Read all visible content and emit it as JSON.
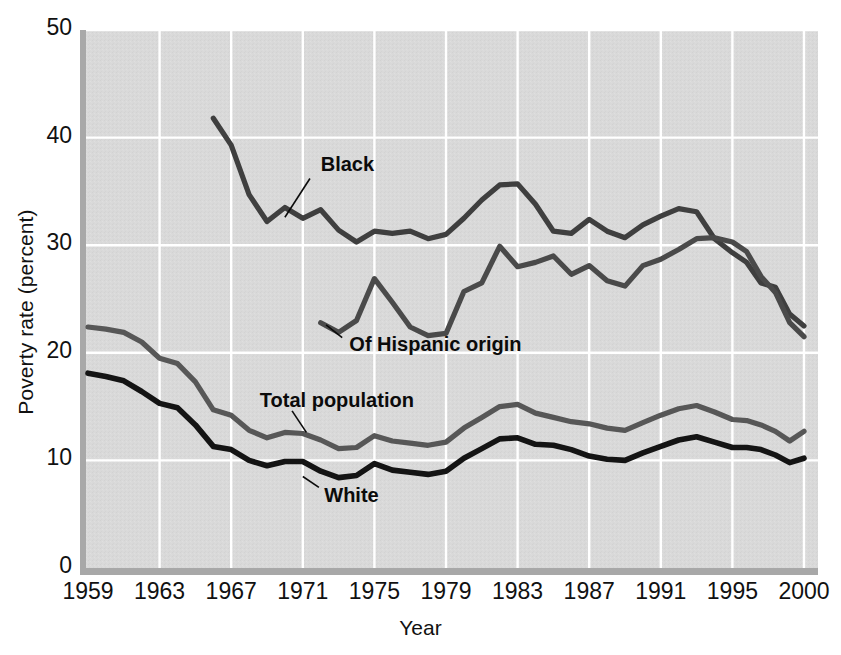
{
  "chart_data": {
    "type": "line",
    "title": "",
    "xlabel": "Year",
    "ylabel": "Poverty rate (percent)",
    "xlim": [
      1959,
      2000
    ],
    "ylim": [
      0,
      50
    ],
    "xticks": [
      "1959",
      "1963",
      "1967",
      "1971",
      "1975",
      "1979",
      "1983",
      "1987",
      "1991",
      "1995",
      "2000"
    ],
    "xtick_values": [
      1959,
      1963,
      1967,
      1971,
      1975,
      1979,
      1983,
      1987,
      1991,
      1995,
      2000
    ],
    "yticks": [
      "0",
      "10",
      "20",
      "30",
      "40",
      "50"
    ],
    "ytick_values": [
      0,
      10,
      20,
      30,
      40,
      50
    ],
    "grid": true,
    "grid_color": "#ffffff",
    "plot_background": "#d8d8d8",
    "legend_position": "inline-annotations",
    "series": [
      {
        "name": "Black",
        "color": "#3f3f3f",
        "label_x": 1972.0,
        "label_y": 37.4,
        "leader_from_x": 1971.4,
        "leader_from_y": 36.2,
        "leader_to_x": 1970.0,
        "leader_to_y": 32.6,
        "x": [
          1966,
          1967,
          1968,
          1969,
          1970,
          1971,
          1972,
          1973,
          1974,
          1975,
          1976,
          1977,
          1978,
          1979,
          1980,
          1981,
          1982,
          1983,
          1984,
          1985,
          1986,
          1987,
          1988,
          1989,
          1990,
          1991,
          1992,
          1993,
          1994,
          1995,
          1996,
          1997,
          1998,
          1999,
          2000
        ],
        "values": [
          41.8,
          39.3,
          34.7,
          32.2,
          33.5,
          32.5,
          33.3,
          31.4,
          30.3,
          31.3,
          31.1,
          31.3,
          30.6,
          31.0,
          32.5,
          34.2,
          35.6,
          35.7,
          33.8,
          31.3,
          31.1,
          32.4,
          31.3,
          30.7,
          31.9,
          32.7,
          33.4,
          33.1,
          30.6,
          29.3,
          28.4,
          26.5,
          26.1,
          23.6,
          22.5
        ],
        "units": "percent"
      },
      {
        "name": "Of Hispanic origin",
        "color": "#4a4a4a",
        "label_x": 1973.6,
        "label_y": 20.6,
        "leader_from_x": 1973.2,
        "leader_from_y": 21.4,
        "leader_to_x": 1972.3,
        "leader_to_y": 22.6,
        "x": [
          1972,
          1973,
          1974,
          1975,
          1976,
          1977,
          1978,
          1979,
          1980,
          1981,
          1982,
          1983,
          1984,
          1985,
          1986,
          1987,
          1988,
          1989,
          1990,
          1991,
          1992,
          1993,
          1994,
          1995,
          1996,
          1997,
          1998,
          1999,
          2000
        ],
        "values": [
          22.8,
          21.9,
          23.0,
          26.9,
          24.7,
          22.4,
          21.6,
          21.8,
          25.7,
          26.5,
          29.9,
          28.0,
          28.4,
          29.0,
          27.3,
          28.1,
          26.7,
          26.2,
          28.1,
          28.7,
          29.6,
          30.6,
          30.7,
          30.3,
          29.4,
          27.1,
          25.6,
          22.8,
          21.5
        ],
        "units": "percent"
      },
      {
        "name": "Total population",
        "color": "#575757",
        "label_x": 1968.6,
        "label_y": 15.4,
        "leader_from_x": 1970.4,
        "leader_from_y": 14.6,
        "leader_to_x": 1971.2,
        "leader_to_y": 12.6,
        "x": [
          1959,
          1960,
          1961,
          1962,
          1963,
          1964,
          1965,
          1966,
          1967,
          1968,
          1969,
          1970,
          1971,
          1972,
          1973,
          1974,
          1975,
          1976,
          1977,
          1978,
          1979,
          1980,
          1981,
          1982,
          1983,
          1984,
          1985,
          1986,
          1987,
          1988,
          1989,
          1990,
          1991,
          1992,
          1993,
          1994,
          1995,
          1996,
          1997,
          1998,
          1999,
          2000
        ],
        "values": [
          22.4,
          22.2,
          21.9,
          21.0,
          19.5,
          19.0,
          17.3,
          14.7,
          14.2,
          12.8,
          12.1,
          12.6,
          12.5,
          11.9,
          11.1,
          11.2,
          12.3,
          11.8,
          11.6,
          11.4,
          11.7,
          13.0,
          14.0,
          15.0,
          15.2,
          14.4,
          14.0,
          13.6,
          13.4,
          13.0,
          12.8,
          13.5,
          14.2,
          14.8,
          15.1,
          14.5,
          13.8,
          13.7,
          13.3,
          12.7,
          11.8,
          12.7
        ],
        "units": "percent"
      },
      {
        "name": "White",
        "color": "#141414",
        "label_x": 1972.2,
        "label_y": 6.6,
        "leader_from_x": 1971.9,
        "leader_from_y": 7.5,
        "leader_to_x": 1971.0,
        "leader_to_y": 8.5,
        "x": [
          1959,
          1960,
          1961,
          1962,
          1963,
          1964,
          1965,
          1966,
          1967,
          1968,
          1969,
          1970,
          1971,
          1972,
          1973,
          1974,
          1975,
          1976,
          1977,
          1978,
          1979,
          1980,
          1981,
          1982,
          1983,
          1984,
          1985,
          1986,
          1987,
          1988,
          1989,
          1990,
          1991,
          1992,
          1993,
          1994,
          1995,
          1996,
          1997,
          1998,
          1999,
          2000
        ],
        "values": [
          18.1,
          17.8,
          17.4,
          16.4,
          15.3,
          14.9,
          13.3,
          11.3,
          11.0,
          10.0,
          9.5,
          9.9,
          9.9,
          9.0,
          8.4,
          8.6,
          9.7,
          9.1,
          8.9,
          8.7,
          9.0,
          10.2,
          11.1,
          12.0,
          12.1,
          11.5,
          11.4,
          11.0,
          10.4,
          10.1,
          10.0,
          10.7,
          11.3,
          11.9,
          12.2,
          11.7,
          11.2,
          11.2,
          11.0,
          10.5,
          9.8,
          10.2
        ],
        "units": "percent"
      }
    ]
  }
}
